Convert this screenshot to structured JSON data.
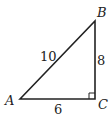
{
  "diagram": {
    "type": "right-triangle",
    "vertices": {
      "A": {
        "label": "A",
        "x": 20,
        "y": 99
      },
      "B": {
        "label": "B",
        "x": 95,
        "y": 21
      },
      "C": {
        "label": "C",
        "x": 95,
        "y": 99
      }
    },
    "sides": {
      "AB": {
        "label": "10"
      },
      "BC": {
        "label": "8"
      },
      "AC": {
        "label": "6"
      }
    },
    "right_angle_at": "C",
    "stroke_color": "#222222",
    "background": "#ffffff"
  }
}
